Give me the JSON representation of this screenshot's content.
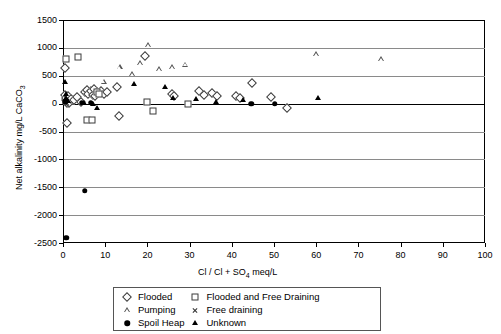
{
  "chart_data": {
    "type": "scatter",
    "title": "",
    "xlabel": "Cl / Cl + SO4 meq/L",
    "ylabel": "Net alkalinity mg/L CaCO3",
    "xlim": [
      0,
      100
    ],
    "ylim": [
      -2500,
      1500
    ],
    "xticks": [
      0,
      10,
      20,
      30,
      40,
      50,
      60,
      70,
      80,
      90,
      100
    ],
    "yticks": [
      1500,
      1000,
      500,
      0,
      -500,
      -1000,
      -1500,
      -2000,
      -2500
    ],
    "grid": "horizontal",
    "legend_position": "bottom-outside",
    "series": [
      {
        "name": "Flooded",
        "marker": "open-diamond",
        "points": [
          [
            0.4,
            640
          ],
          [
            0.5,
            150
          ],
          [
            0.7,
            60
          ],
          [
            0.8,
            95
          ],
          [
            1.0,
            20
          ],
          [
            1.2,
            130
          ],
          [
            1.4,
            10
          ],
          [
            2.0,
            75
          ],
          [
            2.6,
            60
          ],
          [
            3.4,
            120
          ],
          [
            4.2,
            30
          ],
          [
            5.2,
            210
          ],
          [
            5.6,
            250
          ],
          [
            6.0,
            175
          ],
          [
            6.6,
            230
          ],
          [
            7.0,
            160
          ],
          [
            7.4,
            255
          ],
          [
            7.6,
            130
          ],
          [
            8.0,
            205
          ],
          [
            8.4,
            185
          ],
          [
            9.0,
            235
          ],
          [
            9.6,
            170
          ],
          [
            10.4,
            215
          ],
          [
            12.8,
            300
          ],
          [
            19.4,
            860
          ],
          [
            25.8,
            170
          ],
          [
            26.4,
            135
          ],
          [
            32.2,
            220
          ],
          [
            33.4,
            160
          ],
          [
            35.2,
            195
          ],
          [
            36.6,
            140
          ],
          [
            41.0,
            130
          ],
          [
            42.0,
            105
          ],
          [
            44.8,
            370
          ],
          [
            49.4,
            120
          ],
          [
            1.0,
            -350
          ],
          [
            13.2,
            -220
          ],
          [
            53.0,
            -85
          ]
        ]
      },
      {
        "name": "Flooded and Free Draining",
        "marker": "open-square",
        "points": [
          [
            0.6,
            800
          ],
          [
            3.6,
            840
          ],
          [
            8.0,
            215
          ],
          [
            8.6,
            180
          ],
          [
            20.0,
            30
          ],
          [
            29.6,
            0
          ],
          [
            5.6,
            -290
          ],
          [
            6.8,
            -300
          ],
          [
            21.4,
            -130
          ]
        ]
      },
      {
        "name": "Pumping",
        "marker": "open-triangle",
        "points": [
          [
            9.6,
            390
          ],
          [
            16.4,
            530
          ],
          [
            13.4,
            650
          ],
          [
            18.2,
            720
          ],
          [
            20.2,
            1050
          ],
          [
            22.8,
            620
          ],
          [
            25.8,
            655
          ],
          [
            29.0,
            700
          ],
          [
            60.0,
            890
          ],
          [
            75.4,
            800
          ]
        ]
      },
      {
        "name": "Free draining",
        "marker": "cross",
        "points": [
          [
            0.5,
            45
          ],
          [
            0.9,
            5
          ]
        ]
      },
      {
        "name": "Spoil Heap",
        "marker": "filled-circle",
        "points": [
          [
            0.5,
            30
          ],
          [
            4.4,
            15
          ],
          [
            6.6,
            20
          ],
          [
            44.6,
            0
          ],
          [
            50.2,
            0
          ],
          [
            5.2,
            -1560
          ],
          [
            0.8,
            -2410
          ]
        ]
      },
      {
        "name": "Unknown",
        "marker": "filled-triangle",
        "points": [
          [
            0.4,
            390
          ],
          [
            0.6,
            180
          ],
          [
            0.7,
            100
          ],
          [
            1.1,
            55
          ],
          [
            5.0,
            5
          ],
          [
            7.2,
            0
          ],
          [
            8.0,
            -80
          ],
          [
            16.8,
            350
          ],
          [
            24.2,
            300
          ],
          [
            26.0,
            100
          ],
          [
            31.6,
            85
          ],
          [
            36.2,
            25
          ],
          [
            42.6,
            60
          ],
          [
            60.4,
            95
          ]
        ]
      }
    ]
  },
  "axes": {
    "y_title": "Net alkalinity mg/L CaCO",
    "y_title_sub": "3",
    "x_title_pre": "Cl / Cl + SO",
    "x_title_sub": "4",
    "x_title_post": " meq/L",
    "ylabels": [
      "1500",
      "1000",
      "500",
      "0",
      "-500",
      "-1000",
      "-1500",
      "-2000",
      "-2500"
    ],
    "xlabels": [
      "0",
      "10",
      "20",
      "30",
      "40",
      "50",
      "60",
      "70",
      "80",
      "90",
      "100"
    ]
  },
  "legend": {
    "col1": [
      {
        "label": "Flooded",
        "marker": "open-diamond"
      },
      {
        "label": "Pumping",
        "marker": "open-triangle"
      },
      {
        "label": "Spoil Heap",
        "marker": "filled-circle"
      }
    ],
    "col2": [
      {
        "label": "Flooded and Free Draining",
        "marker": "open-square"
      },
      {
        "label": "Free draining",
        "marker": "cross"
      },
      {
        "label": "Unknown",
        "marker": "filled-triangle"
      }
    ]
  },
  "colors": {
    "axis": "#000000",
    "grid": "#8a8a8a",
    "marker_open": "#3b3b3b",
    "marker_fill": "#000000",
    "background": "#ffffff"
  }
}
